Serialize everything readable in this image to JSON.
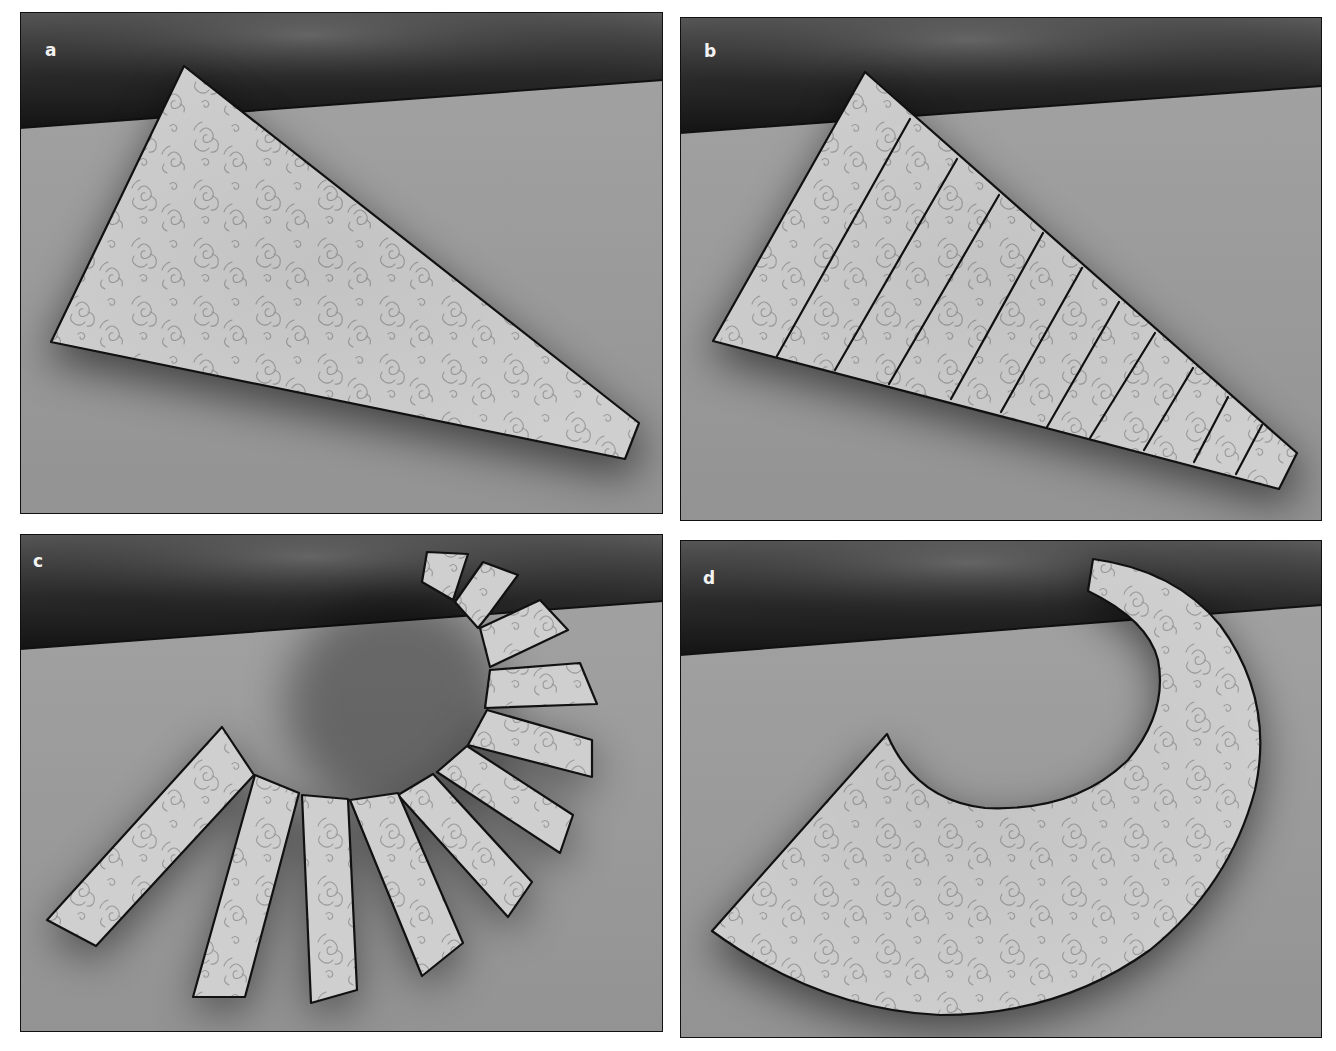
{
  "figure": {
    "colors": {
      "page_background": "#ffffff",
      "floor": "#9c9c9c",
      "wall_dark": "#1c1c1c",
      "wall_light": "#6a6a6a",
      "sheet_fill": "#cfcfcf",
      "pattern_stroke": "#9a9a9a",
      "outline": "#111111",
      "label": "#f2f2f2"
    },
    "panels": [
      {
        "id": "a",
        "label": "a",
        "caption_role": "original triangular sheet with swirl pattern",
        "frame": {
          "x": 20,
          "y": 12,
          "w": 643,
          "h": 502
        },
        "horizon": {
          "left_y": 128,
          "right_y": 80
        },
        "shape": {
          "type": "polygon",
          "points": [
            [
              184,
              66
            ],
            [
              639,
              423
            ],
            [
              625,
              459
            ],
            [
              51,
              342
            ]
          ]
        }
      },
      {
        "id": "b",
        "label": "b",
        "caption_role": "sheet divided into 11 strips by 10 cut lines",
        "frame": {
          "x": 680,
          "y": 17,
          "w": 642,
          "h": 504
        },
        "horizon": {
          "left_y": 133,
          "right_y": 86
        },
        "shape": {
          "type": "polygon",
          "points": [
            [
              865,
              72
            ],
            [
              1297,
              453
            ],
            [
              1279,
              489
            ],
            [
              713,
              341
            ]
          ]
        },
        "strip_count": 11,
        "cut_lines": [
          [
            [
              910,
              119
            ],
            [
              777,
              356
            ]
          ],
          [
            [
              957,
              159
            ],
            [
              835,
              370
            ]
          ],
          [
            [
              999,
              195
            ],
            [
              889,
              384
            ]
          ],
          [
            [
              1043,
              233
            ],
            [
              951,
              399
            ]
          ],
          [
            [
              1082,
              268
            ],
            [
              1001,
              412
            ]
          ],
          [
            [
              1119,
              302
            ],
            [
              1047,
              427
            ]
          ],
          [
            [
              1155,
              333
            ],
            [
              1090,
              438
            ]
          ],
          [
            [
              1193,
              368
            ],
            [
              1144,
              450
            ]
          ],
          [
            [
              1228,
              397
            ],
            [
              1194,
              462
            ]
          ],
          [
            [
              1262,
              425
            ],
            [
              1236,
              474
            ]
          ]
        ]
      },
      {
        "id": "c",
        "label": "c",
        "caption_role": "strips separated and fanned around a circle",
        "frame": {
          "x": 20,
          "y": 534,
          "w": 643,
          "h": 498
        },
        "horizon": {
          "left_y": 649,
          "right_y": 601
        },
        "strip_count": 11,
        "strips": [
          [
            [
              427,
              552
            ],
            [
              468,
              554
            ],
            [
              453,
              600
            ],
            [
              422,
              582
            ]
          ],
          [
            [
              483,
              562
            ],
            [
              518,
              575
            ],
            [
              490,
              613
            ],
            [
              478,
              628
            ],
            [
              455,
              602
            ]
          ],
          [
            [
              480,
              628
            ],
            [
              540,
              600
            ],
            [
              568,
              630
            ],
            [
              490,
              667
            ]
          ],
          [
            [
              490,
              670
            ],
            [
              580,
              663
            ],
            [
              597,
              704
            ],
            [
              485,
              708
            ]
          ],
          [
            [
              487,
              710
            ],
            [
              592,
              740
            ],
            [
              592,
              777
            ],
            [
              468,
              745
            ]
          ],
          [
            [
              467,
              746
            ],
            [
              573,
              815
            ],
            [
              560,
              853
            ],
            [
              437,
              772
            ]
          ],
          [
            [
              433,
              774
            ],
            [
              532,
              882
            ],
            [
              508,
              917
            ],
            [
              398,
              795
            ]
          ],
          [
            [
              398,
              793
            ],
            [
              463,
              943
            ],
            [
              422,
              976
            ],
            [
              350,
              800
            ]
          ],
          [
            [
              302,
              795
            ],
            [
              348,
              799
            ],
            [
              357,
              990
            ],
            [
              311,
              1003
            ]
          ],
          [
            [
              255,
              775
            ],
            [
              299,
              793
            ],
            [
              245,
              997
            ],
            [
              193,
              997
            ]
          ],
          [
            [
              222,
              727
            ],
            [
              254,
              775
            ],
            [
              96,
              946
            ],
            [
              47,
              920
            ]
          ]
        ]
      },
      {
        "id": "d",
        "label": "d",
        "caption_role": "strips rejoined into a curved annular sector",
        "frame": {
          "x": 680,
          "y": 540,
          "w": 642,
          "h": 498
        },
        "horizon": {
          "left_y": 655,
          "right_y": 605
        },
        "shape": {
          "type": "path",
          "d": "M712,931 L887,734 Q915,800 985,808 Q1075,812 1128,760 Q1168,712 1158,660 Q1148,620 1088,591 L1093,559 Q1175,570 1220,625 Q1275,700 1255,790 Q1230,885 1150,950 Q1060,1015 940,1015 Q820,1010 712,931 Z"
        }
      }
    ]
  }
}
